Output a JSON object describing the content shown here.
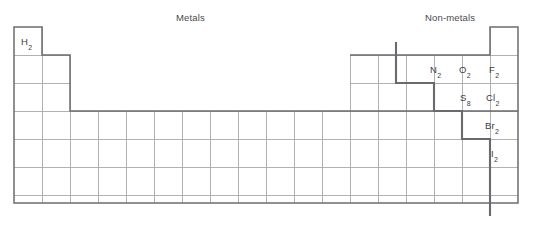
{
  "diagram": {
    "title_metals": "Metals",
    "title_nonmetals": "Non-metals",
    "region_labels": [
      {
        "name": "metals",
        "text": "Metals",
        "x": 176,
        "y": 12
      },
      {
        "name": "nonmetals",
        "text": "Non-metals",
        "x": 425,
        "y": 12
      }
    ],
    "colors": {
      "grid": "#a9a9ad",
      "outline": "#6c6c70",
      "staircase": "#6a6a6e",
      "text": "#3b3b3f",
      "background": "#ffffff"
    },
    "grid": {
      "columns": 18,
      "rows": 7,
      "cell_width": 28,
      "cell_height": 28,
      "origin_x": 14,
      "origin_y": 27
    },
    "elements": [
      {
        "name": "hydrogen",
        "formula": "H",
        "subscript": "2",
        "group": 1,
        "period": 1,
        "x": 21,
        "y": 36
      },
      {
        "name": "nitrogen",
        "formula": "N",
        "subscript": "2",
        "group": 15,
        "period": 2,
        "x": 430,
        "y": 64
      },
      {
        "name": "oxygen",
        "formula": "O",
        "subscript": "2",
        "group": 16,
        "period": 2,
        "x": 459,
        "y": 64
      },
      {
        "name": "fluorine",
        "formula": "F",
        "subscript": "2",
        "group": 17,
        "period": 2,
        "x": 489,
        "y": 64
      },
      {
        "name": "sulfur",
        "formula": "S",
        "subscript": "8",
        "group": 16,
        "period": 3,
        "x": 460,
        "y": 92
      },
      {
        "name": "chlorine",
        "formula": "Cl",
        "subscript": "2",
        "group": 17,
        "period": 3,
        "x": 486,
        "y": 92
      },
      {
        "name": "bromine",
        "formula": "Br",
        "subscript": "2",
        "group": 17,
        "period": 4,
        "x": 485,
        "y": 120
      },
      {
        "name": "iodine",
        "formula": "I",
        "subscript": "2",
        "group": 17,
        "period": 5,
        "x": 491,
        "y": 148
      }
    ]
  }
}
